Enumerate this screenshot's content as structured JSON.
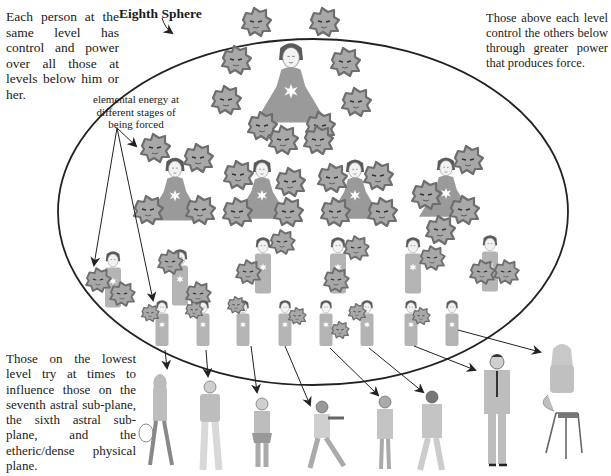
{
  "diagram": {
    "title": "Eighth Sphere",
    "colors": {
      "ellipse_stroke": "#222222",
      "gown_fill": "#9a9a9a",
      "gown_light_fill": "#b4b4b4",
      "face_fill": "#f2f2f2",
      "hair_fill": "#5a5a5a",
      "elemental_fill": "#a8a8a8",
      "elemental_edge": "#6e6e6e",
      "star_fill": "#ffffff",
      "arrow": "#222222",
      "human_fill": "#bdbdbd",
      "human_dark": "#555555"
    },
    "annotations": {
      "top_left": "Each person at the same level has control and power over all those at levels below him or her.",
      "top_right": "Those above each level control the others below through greater power that produces force.",
      "elemental_label": "elemental energy at different stages of being forced",
      "bottom_left": "Those on the lowest level try at times to influence those on the seventh astral sub-plane, the sixth astral sub-plane, and the etheric/dense physical plane."
    },
    "levels": [
      {
        "name": "level-1",
        "figures": [
          {
            "x": 291,
            "y": 42,
            "scale": 1.15,
            "elementals": 8
          }
        ]
      },
      {
        "name": "level-2",
        "figures": [
          {
            "x": 171,
            "y": 150,
            "scale": 0.95,
            "elementals": 4
          },
          {
            "x": 262,
            "y": 155,
            "scale": 0.9,
            "elementals": 5
          },
          {
            "x": 355,
            "y": 155,
            "scale": 0.9,
            "elementals": 5
          },
          {
            "x": 448,
            "y": 152,
            "scale": 0.9,
            "elementals": 4
          }
        ]
      },
      {
        "name": "level-3",
        "figures": [
          {
            "x": 113,
            "y": 247,
            "scale": 0.8,
            "elementals": 2
          },
          {
            "x": 175,
            "y": 245,
            "scale": 0.8,
            "elementals": 2
          },
          {
            "x": 263,
            "y": 228,
            "scale": 0.8,
            "elementals": 2
          },
          {
            "x": 356,
            "y": 228,
            "scale": 0.8,
            "elementals": 2
          },
          {
            "x": 413,
            "y": 230,
            "scale": 0.8,
            "elementals": 1
          },
          {
            "x": 490,
            "y": 228,
            "scale": 0.8,
            "elementals": 2
          }
        ]
      },
      {
        "name": "level-4",
        "figures": [
          {
            "x": 162,
            "y": 292
          },
          {
            "x": 203,
            "y": 292
          },
          {
            "x": 243,
            "y": 292
          },
          {
            "x": 285,
            "y": 292
          },
          {
            "x": 326,
            "y": 292
          },
          {
            "x": 367,
            "y": 292
          },
          {
            "x": 411,
            "y": 292
          },
          {
            "x": 452,
            "y": 292
          }
        ]
      }
    ],
    "physical_people": [
      {
        "label": "woman-with-hat",
        "x": 160
      },
      {
        "label": "young-man",
        "x": 210
      },
      {
        "label": "girl-with-toy",
        "x": 262
      },
      {
        "label": "armed-soldier",
        "x": 322
      },
      {
        "label": "businesswoman",
        "x": 385
      },
      {
        "label": "man-in-jacket",
        "x": 432
      },
      {
        "label": "man-in-suit",
        "x": 497
      },
      {
        "label": "woman-on-stool",
        "x": 562
      }
    ]
  }
}
